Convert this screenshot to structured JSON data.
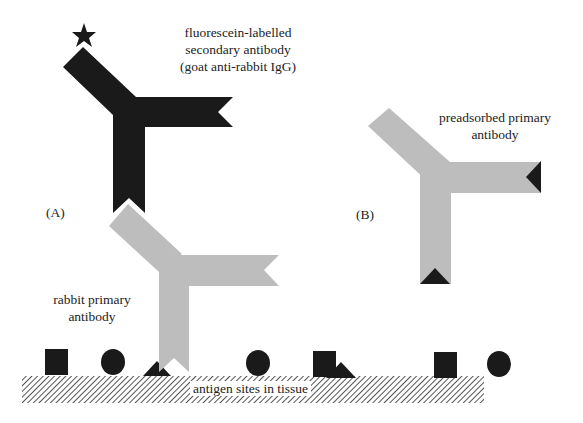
{
  "diagram": {
    "type": "immunofluorescence-schematic",
    "panels": [
      {
        "id": "A",
        "label": "(A)"
      },
      {
        "id": "B",
        "label": "(B)"
      }
    ],
    "labels": {
      "secondary_line1": "fluorescein-labelled",
      "secondary_line2": "secondary antibody",
      "secondary_line3": "(goat anti-rabbit IgG)",
      "primary_line1": "rabbit primary",
      "primary_line2": "antibody",
      "preadsorbed_line1": "preadsorbed primary",
      "preadsorbed_line2": "antibody",
      "panel_a": "(A)",
      "panel_b": "(B)",
      "tissue": "antigen sites in tissue"
    },
    "antigens": [
      "square",
      "circle",
      "triangle",
      "circle",
      "square",
      "triangle",
      "square",
      "circle"
    ],
    "colors": {
      "secondary_antibody": "#1a1a1a",
      "primary_antibody": "#bdbdbd",
      "antigen": "#1a1a1a",
      "tissue_hatch": "#555555",
      "label_star": "#1a1a1a"
    }
  }
}
